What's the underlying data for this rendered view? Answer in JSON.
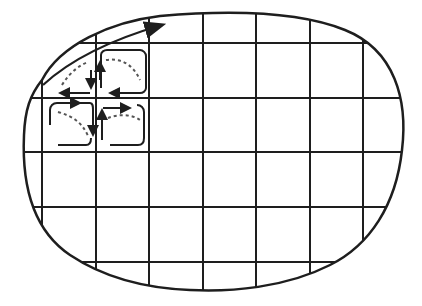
{
  "diagram": {
    "title": "",
    "colors": {
      "stroke": "#1e1e1e",
      "background": "#ffffff",
      "dashed": "#555555"
    },
    "grid": {
      "vertical_x": [
        42,
        96,
        149,
        203,
        256,
        310,
        363
      ],
      "horizontal_y": [
        43,
        98,
        152,
        207,
        262
      ]
    },
    "boundary_label": "",
    "flow_arrow": {
      "direction": "along-boundary-upper-right"
    },
    "circulation_cells": [
      {
        "id": "cell-top-left",
        "rotation": "counterclockwise"
      },
      {
        "id": "cell-top-right",
        "rotation": "clockwise"
      },
      {
        "id": "cell-bottom-left",
        "rotation": "clockwise"
      },
      {
        "id": "cell-bottom-right",
        "rotation": "counterclockwise"
      }
    ]
  }
}
